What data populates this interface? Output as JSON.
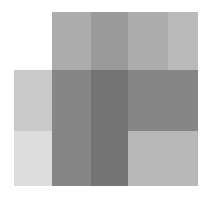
{
  "figure": {
    "title": "Overlapping translucent gray rectangles",
    "width": 210,
    "height": 198,
    "background": "#ffffff"
  },
  "chart_data": {
    "type": "heatmap",
    "title": "Overlapping translucent gray rectangles",
    "xlabel": "",
    "ylabel": "",
    "grid": false,
    "legend": "none",
    "colorscale": "grayscale",
    "x_edges": [
      14,
      52,
      91,
      128,
      168,
      198
    ],
    "y_edges": [
      12,
      70,
      131,
      186
    ],
    "columns": [
      "c0",
      "c1",
      "c2",
      "c3",
      "c4"
    ],
    "rows": [
      "r0",
      "r1",
      "r2"
    ],
    "cells": [
      {
        "row": "r0",
        "col": "c0",
        "x": 14,
        "y": 12,
        "w": 38,
        "h": 58,
        "value": 1.0,
        "color": "#ffffff"
      },
      {
        "row": "r0",
        "col": "c1",
        "x": 52,
        "y": 12,
        "w": 39,
        "h": 58,
        "value": 0.67,
        "color": "#acacac"
      },
      {
        "row": "r0",
        "col": "c2",
        "x": 91,
        "y": 12,
        "w": 37,
        "h": 58,
        "value": 0.6,
        "color": "#9a9a9a"
      },
      {
        "row": "r0",
        "col": "c3",
        "x": 128,
        "y": 12,
        "w": 40,
        "h": 58,
        "value": 0.67,
        "color": "#acacac"
      },
      {
        "row": "r0",
        "col": "c4",
        "x": 168,
        "y": 12,
        "w": 30,
        "h": 58,
        "value": 0.73,
        "color": "#bababa"
      },
      {
        "row": "r1",
        "col": "c0",
        "x": 14,
        "y": 70,
        "w": 38,
        "h": 61,
        "value": 0.79,
        "color": "#c9c9c9"
      },
      {
        "row": "r1",
        "col": "c1",
        "x": 52,
        "y": 70,
        "w": 39,
        "h": 61,
        "value": 0.52,
        "color": "#868686"
      },
      {
        "row": "r1",
        "col": "c2",
        "x": 91,
        "y": 70,
        "w": 37,
        "h": 61,
        "value": 0.45,
        "color": "#747474"
      },
      {
        "row": "r1",
        "col": "c3",
        "x": 128,
        "y": 70,
        "w": 40,
        "h": 61,
        "value": 0.52,
        "color": "#868686"
      },
      {
        "row": "r1",
        "col": "c4",
        "x": 168,
        "y": 70,
        "w": 30,
        "h": 61,
        "value": 0.52,
        "color": "#868686"
      },
      {
        "row": "r2",
        "col": "c0",
        "x": 14,
        "y": 131,
        "w": 38,
        "h": 55,
        "value": 0.87,
        "color": "#dddddd"
      },
      {
        "row": "r2",
        "col": "c1",
        "x": 52,
        "y": 131,
        "w": 39,
        "h": 55,
        "value": 0.52,
        "color": "#868686"
      },
      {
        "row": "r2",
        "col": "c2",
        "x": 91,
        "y": 131,
        "w": 37,
        "h": 55,
        "value": 0.45,
        "color": "#747474"
      },
      {
        "row": "r2",
        "col": "c3",
        "x": 128,
        "y": 131,
        "w": 40,
        "h": 55,
        "value": 0.73,
        "color": "#b8b8b8"
      },
      {
        "row": "r2",
        "col": "c4",
        "x": 168,
        "y": 131,
        "w": 30,
        "h": 55,
        "value": 0.73,
        "color": "#b8b8b8"
      }
    ],
    "shapes": [
      {
        "name": "vertical-rectangle",
        "x": 52,
        "y": 12,
        "w": 146,
        "h": 174,
        "fill": "#9a9a9a",
        "opacity": 0.62
      },
      {
        "name": "horizontal-rectangle",
        "x": 14,
        "y": 70,
        "w": 184,
        "h": 116,
        "fill": "#8f8f8f",
        "opacity": 0.55
      }
    ]
  }
}
